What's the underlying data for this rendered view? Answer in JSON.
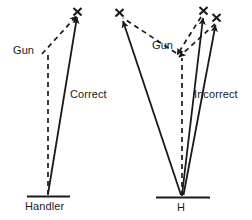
{
  "figure": {
    "stroke_color": "#1a1a1a",
    "background_color": "#ffffff",
    "panels": [
      {
        "id": "left",
        "name": "correct-panel",
        "base_label": "Handler",
        "gun_label": "Gun",
        "line_label": "Correct",
        "targets": 1
      },
      {
        "id": "right",
        "name": "incorrect-panel",
        "base_label": "H",
        "gun_label": "Gun",
        "line_label": "Incorrect",
        "targets": 3
      }
    ],
    "labels": {
      "gun_left": "Gun",
      "gun_right": "Gun",
      "correct": "Correct",
      "incorrect": "Incorrect",
      "handler": "Handler",
      "h": "H"
    },
    "markers": {
      "target_glyph": "x",
      "target_glyph_name": "x-target-mark"
    },
    "legend_notes": {
      "dashed_meaning": "gun sight line",
      "solid_meaning": "handler line of aim"
    }
  }
}
